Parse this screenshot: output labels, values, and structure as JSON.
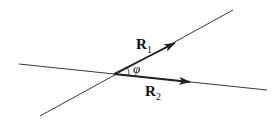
{
  "diagram": {
    "vectors": [
      {
        "name": "R1",
        "label": "R",
        "subscript": "1"
      },
      {
        "name": "R2",
        "label": "R",
        "subscript": "2"
      }
    ],
    "angle": {
      "symbol": "φ"
    },
    "colors": {
      "line": "#222222",
      "background": "#ffffff"
    }
  }
}
